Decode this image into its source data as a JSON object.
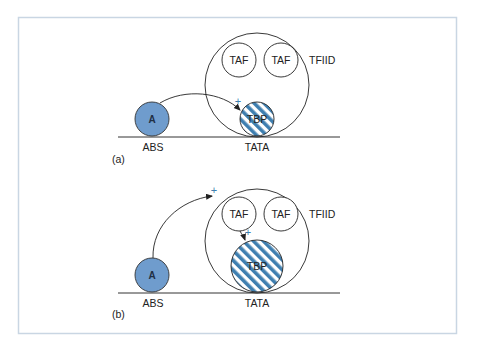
{
  "colors": {
    "frame": "#c9d6e3",
    "activator_fill": "#6f9ccd",
    "stripe_blue": "#3f7fb0",
    "plus": "#3f7fb0",
    "line": "#222222"
  },
  "panels": [
    {
      "id": "a",
      "label": "(a)",
      "activator": {
        "label": "A",
        "site": "ABS"
      },
      "complex": {
        "label": "TFIID",
        "taf_left": "TAF",
        "taf_right": "TAF",
        "tbp": "TBP",
        "site": "TATA"
      },
      "plus_signs": [
        "+"
      ]
    },
    {
      "id": "b",
      "label": "(b)",
      "activator": {
        "label": "A",
        "site": "ABS"
      },
      "complex": {
        "label": "TFIID",
        "taf_left": "TAF",
        "taf_right": "TAF",
        "tbp": "TBP",
        "site": "TATA"
      },
      "plus_signs": [
        "+",
        "+"
      ]
    }
  ]
}
